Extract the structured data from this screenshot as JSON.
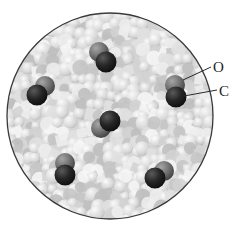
{
  "diagram": {
    "circle": {
      "cx": 110,
      "cy": 116,
      "r": 103,
      "border_color": "#3a3a3a",
      "fill_color": "#d6d6d6"
    },
    "labels": [
      {
        "id": "O",
        "text": "O",
        "x": 213,
        "y": 60,
        "line_from": [
          183,
          80
        ],
        "line_to": [
          211,
          67
        ]
      },
      {
        "id": "C",
        "text": "C",
        "x": 219,
        "y": 84,
        "line_from": [
          184,
          96
        ],
        "line_to": [
          217,
          90
        ]
      }
    ],
    "atom_colors": {
      "O": "#7a7a7a",
      "C": "#262626"
    },
    "atom_radius": 10,
    "molecules": [
      {
        "name": "CO",
        "O": [
          99,
          52
        ],
        "C": [
          106,
          62
        ]
      },
      {
        "name": "CO",
        "O": [
          45,
          86
        ],
        "C": [
          37,
          95
        ]
      },
      {
        "name": "CO",
        "O": [
          175,
          85
        ],
        "C": [
          176,
          97
        ]
      },
      {
        "name": "CO",
        "O": [
          101,
          128
        ],
        "C": [
          110,
          121
        ]
      },
      {
        "name": "CO",
        "O": [
          65,
          163
        ],
        "C": [
          65,
          175
        ]
      },
      {
        "name": "CO",
        "O": [
          164,
          171
        ],
        "C": [
          155,
          178
        ]
      }
    ],
    "background_particle_colors": [
      "#efefef",
      "#e2e2e2",
      "#d2d2d2",
      "#c4c4c4",
      "#f7f7f7",
      "#bdbdbd"
    ]
  }
}
